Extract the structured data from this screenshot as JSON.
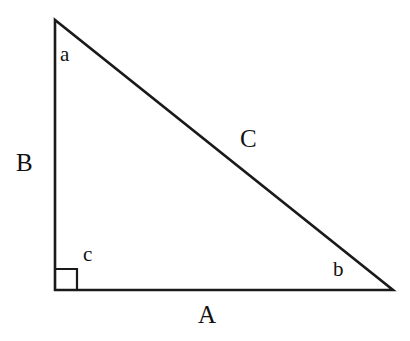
{
  "figure": {
    "kind": "right-triangle-diagram",
    "background_color": "#ffffff",
    "stroke_color": "#1a1a1a",
    "stroke_width": 2.6,
    "width": 410,
    "height": 341
  },
  "geometry": {
    "vertices": {
      "top": {
        "name": "apex-vertex",
        "x": 55,
        "y": 20
      },
      "bottom_left": {
        "name": "right-angle-vertex",
        "x": 55,
        "y": 290
      },
      "bottom_right": {
        "name": "right-vertex",
        "x": 393,
        "y": 290
      }
    },
    "right_angle_marker": {
      "name": "right-angle-square",
      "x": 56,
      "y": 269,
      "size": 21
    }
  },
  "labels": {
    "side_vertical": "B",
    "side_horizontal": "A",
    "side_hypotenuse": "C",
    "angle_top": "a",
    "angle_right": "b",
    "angle_bottom_left": "c"
  },
  "chart_data": {
    "type": "diagram",
    "title": "",
    "shape": "right triangle",
    "sides": [
      {
        "label": "A",
        "role": "horizontal leg (base)",
        "from": "bottom-left",
        "to": "bottom-right",
        "pixel_length": 338
      },
      {
        "label": "B",
        "role": "vertical leg",
        "from": "bottom-left",
        "to": "apex",
        "pixel_length": 270
      },
      {
        "label": "C",
        "role": "hypotenuse",
        "from": "apex",
        "to": "bottom-right",
        "pixel_length": 432
      }
    ],
    "angles": [
      {
        "label": "a",
        "at": "apex (top-left vertex)",
        "opposite_side": "A"
      },
      {
        "label": "b",
        "at": "bottom-right vertex",
        "opposite_side": "B"
      },
      {
        "label": "c",
        "at": "bottom-left vertex",
        "opposite_side": "C",
        "is_right_angle": true
      }
    ]
  }
}
